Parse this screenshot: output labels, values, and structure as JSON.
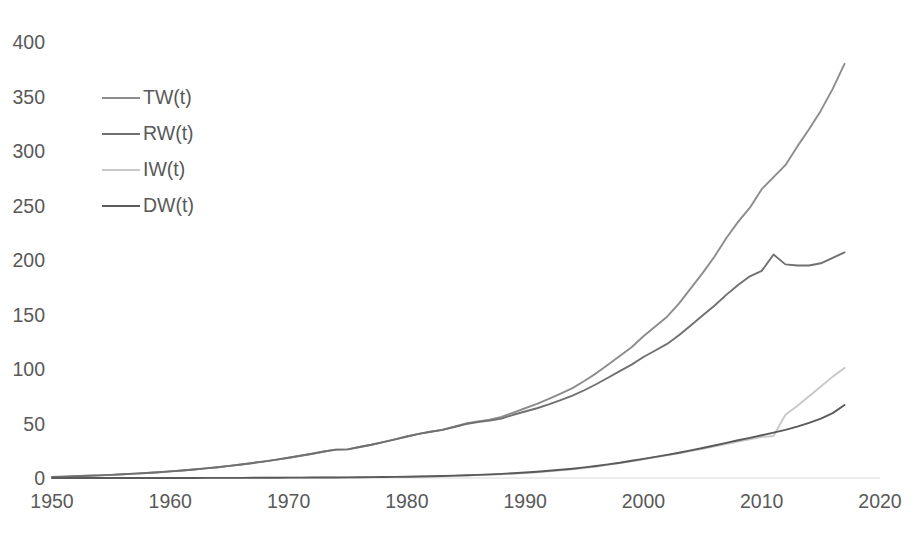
{
  "chart_data": {
    "type": "line",
    "title": "",
    "subtitle": "",
    "xlabel": "",
    "ylabel": "",
    "xlim": [
      1950,
      2020
    ],
    "ylim": [
      0,
      400
    ],
    "xticks": [
      1950,
      1960,
      1970,
      1980,
      1990,
      2000,
      2010,
      2020
    ],
    "yticks": [
      0,
      50,
      100,
      150,
      200,
      250,
      300,
      350,
      400
    ],
    "xtick_labels": [
      "1950",
      "1960",
      "1970",
      "1980",
      "1990",
      "2000",
      "2010",
      "2020"
    ],
    "ytick_labels": [
      "0",
      "50",
      "100",
      "150",
      "200",
      "250",
      "300",
      "350",
      "400"
    ],
    "grid": false,
    "legend_position": "upper-left-inside",
    "x": [
      1950,
      1951,
      1952,
      1953,
      1954,
      1955,
      1956,
      1957,
      1958,
      1959,
      1960,
      1961,
      1962,
      1963,
      1964,
      1965,
      1966,
      1967,
      1968,
      1969,
      1970,
      1971,
      1972,
      1973,
      1974,
      1975,
      1976,
      1977,
      1978,
      1979,
      1980,
      1981,
      1982,
      1983,
      1984,
      1985,
      1986,
      1987,
      1988,
      1989,
      1990,
      1991,
      1992,
      1993,
      1994,
      1995,
      1996,
      1997,
      1998,
      1999,
      2000,
      2001,
      2002,
      2003,
      2004,
      2005,
      2006,
      2007,
      2008,
      2009,
      2010,
      2011,
      2012,
      2013,
      2014,
      2015,
      2016,
      2017
    ],
    "series": [
      {
        "name": "TW(t)",
        "color": "#8c8c8c",
        "values": [
          1.0,
          1.3,
          1.6,
          2.0,
          2.4,
          2.9,
          3.4,
          4.0,
          4.6,
          5.3,
          6.1,
          6.9,
          7.8,
          8.8,
          9.9,
          11.1,
          12.4,
          13.8,
          15.3,
          16.9,
          18.6,
          20.4,
          22.3,
          24.3,
          26.0,
          26.3,
          28.4,
          30.5,
          32.9,
          35.5,
          38.1,
          40.5,
          42.4,
          44.2,
          47.0,
          50.0,
          52.0,
          53.5,
          56.0,
          60.0,
          64.0,
          68.0,
          72.5,
          77.5,
          82.5,
          89.0,
          96.0,
          104.0,
          112.0,
          120.0,
          130.0,
          139.0,
          148.0,
          160.0,
          174.0,
          188.0,
          203.0,
          220.0,
          235.0,
          248.0,
          265.0,
          276.0,
          287.0,
          304.0,
          320.0,
          337.0,
          357.0,
          380.0
        ]
      },
      {
        "name": "RW(t)",
        "color": "#707070",
        "values": [
          1.0,
          1.3,
          1.6,
          2.0,
          2.4,
          2.9,
          3.4,
          4.0,
          4.6,
          5.3,
          6.1,
          6.9,
          7.8,
          8.8,
          9.9,
          11.1,
          12.4,
          13.8,
          15.3,
          16.9,
          18.6,
          20.4,
          22.3,
          24.3,
          26.0,
          26.3,
          28.4,
          30.5,
          32.9,
          35.5,
          38.1,
          40.5,
          42.4,
          44.2,
          46.8,
          49.5,
          51.3,
          52.6,
          54.5,
          58.0,
          61.0,
          64.0,
          67.5,
          71.5,
          75.5,
          80.5,
          86.0,
          92.0,
          98.0,
          104.0,
          111.0,
          117.0,
          123.0,
          131.0,
          140.0,
          149.0,
          158.0,
          168.0,
          177.0,
          185.0,
          190.0,
          205.0,
          196.0,
          195.0,
          195.0,
          197.0,
          202.0,
          207.0
        ]
      },
      {
        "name": "IW(t)",
        "color": "#c8c8c8",
        "values": [
          0.0,
          0.0,
          0.0,
          0.0,
          0.0,
          0.0,
          0.0,
          0.0,
          0.0,
          0.0,
          0.0,
          0.0,
          0.0,
          0.0,
          0.1,
          0.1,
          0.1,
          0.1,
          0.2,
          0.2,
          0.2,
          0.3,
          0.3,
          0.4,
          0.4,
          0.5,
          0.6,
          0.7,
          0.8,
          0.9,
          1.0,
          1.2,
          1.4,
          1.6,
          1.9,
          2.2,
          2.6,
          3.0,
          3.5,
          4.0,
          4.6,
          5.3,
          6.1,
          7.0,
          8.0,
          9.2,
          10.5,
          12.0,
          13.6,
          15.3,
          17.2,
          19.0,
          20.8,
          22.7,
          24.7,
          26.8,
          29.0,
          31.2,
          33.5,
          35.5,
          37.5,
          38.5,
          58.0,
          66.0,
          75.0,
          84.0,
          93.0,
          101.0
        ]
      },
      {
        "name": "DW(t)",
        "color": "#5a5a5a",
        "values": [
          0.0,
          0.0,
          0.0,
          0.0,
          0.0,
          0.0,
          0.0,
          0.0,
          0.0,
          0.0,
          0.0,
          0.0,
          0.0,
          0.1,
          0.1,
          0.1,
          0.1,
          0.2,
          0.2,
          0.2,
          0.3,
          0.3,
          0.4,
          0.4,
          0.5,
          0.6,
          0.7,
          0.8,
          0.9,
          1.0,
          1.2,
          1.4,
          1.6,
          1.9,
          2.2,
          2.5,
          2.9,
          3.3,
          3.8,
          4.4,
          5.0,
          5.8,
          6.6,
          7.5,
          8.5,
          9.7,
          11.0,
          12.5,
          14.0,
          15.8,
          17.6,
          19.4,
          21.2,
          23.2,
          25.3,
          27.5,
          29.8,
          32.2,
          34.6,
          36.8,
          39.2,
          41.6,
          44.2,
          47.2,
          50.5,
          54.5,
          59.5,
          67.0
        ]
      }
    ]
  },
  "legend": {
    "items": [
      {
        "label": "TW(t)",
        "color": "#8c8c8c"
      },
      {
        "label": "RW(t)",
        "color": "#707070"
      },
      {
        "label": "IW(t)",
        "color": "#c8c8c8"
      },
      {
        "label": "DW(t)",
        "color": "#5a5a5a"
      }
    ]
  },
  "axes": {
    "baseline_color": "#d9d9d9"
  },
  "footer": {
    "note": ""
  }
}
